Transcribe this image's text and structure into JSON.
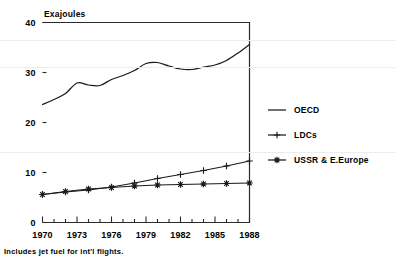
{
  "chart_data": {
    "type": "line",
    "title": "",
    "subtitle": "",
    "ylabel": "Exajoules",
    "xlabel": "",
    "xlim": [
      1970,
      1988
    ],
    "ylim": [
      0,
      40
    ],
    "yticks": [
      0,
      10,
      20,
      30,
      40
    ],
    "ytick_labels": [
      "0",
      "10",
      "20",
      "30",
      "40"
    ],
    "xticks": [
      1970,
      1973,
      1976,
      1979,
      1982,
      1985,
      1988
    ],
    "xtick_labels": [
      "1970",
      "1973",
      "1976",
      "1979",
      "1982",
      "1985",
      "1988"
    ],
    "xminor_step": 1,
    "grid": false,
    "legend_position": "right",
    "annotation": "Includes jet fuel for int'l flights.",
    "series": [
      {
        "name": "OECD",
        "marker": "none",
        "x": [
          1970,
          1971,
          1972,
          1973,
          1974,
          1975,
          1976,
          1977,
          1978,
          1979,
          1980,
          1981,
          1982,
          1983,
          1984,
          1985,
          1986,
          1987,
          1988
        ],
        "values": [
          23.6,
          24.6,
          25.8,
          27.9,
          27.5,
          27.4,
          28.6,
          29.4,
          30.4,
          31.8,
          32.0,
          31.3,
          30.7,
          30.6,
          31.1,
          31.5,
          32.4,
          33.9,
          35.6
        ]
      },
      {
        "name": "LDCs",
        "marker": "plus",
        "x": [
          1970,
          1972,
          1974,
          1976,
          1978,
          1980,
          1982,
          1984,
          1986,
          1988
        ],
        "values": [
          5.6,
          6.1,
          6.5,
          7.1,
          7.9,
          8.8,
          9.6,
          10.4,
          11.3,
          12.3
        ]
      },
      {
        "name": "USSR & E.Europe",
        "marker": "star",
        "x": [
          1970,
          1972,
          1974,
          1976,
          1978,
          1980,
          1982,
          1984,
          1986,
          1988
        ],
        "values": [
          5.6,
          6.2,
          6.7,
          7.0,
          7.3,
          7.5,
          7.6,
          7.7,
          7.8,
          7.9
        ]
      }
    ]
  },
  "legend": {
    "items": [
      {
        "label": "OECD",
        "marker": "line"
      },
      {
        "label": "LDCs",
        "marker": "plus"
      },
      {
        "label": "USSR & E.Europe",
        "marker": "star"
      }
    ]
  },
  "footnote": {
    "text": "Includes jet fuel for int'l flights."
  },
  "colors": {
    "ink": "#1a1a1a",
    "background": "#ffffff",
    "axis": "#2b2b2b"
  }
}
